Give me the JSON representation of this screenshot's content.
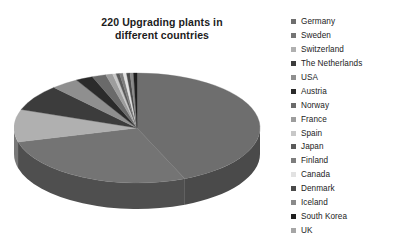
{
  "title": {
    "line1": "220 Upgrading plants in",
    "line2": "different countries"
  },
  "chart_data": {
    "type": "pie",
    "title": "220 Upgrading plants in different countries",
    "subtitle": "",
    "xlabel": "",
    "ylabel": "",
    "total": 220,
    "three_d": true,
    "legend_position": "right",
    "grid": false,
    "categories": [
      "Germany",
      "Sweden",
      "Switzerland",
      "The Netherlands",
      "USA",
      "Austria",
      "Norway",
      "France",
      "Spain",
      "Japan",
      "Finland",
      "Canada",
      "Denmark",
      "Iceland",
      "South Korea",
      "UK"
    ],
    "values": [
      96,
      60,
      21,
      17,
      8,
      5,
      4,
      2,
      1,
      1,
      1,
      1,
      1,
      1,
      1,
      0
    ],
    "slice_colors": [
      "#6e6e6e",
      "#747474",
      "#b0b0b0",
      "#3c3c3c",
      "#8f8f8f",
      "#2b2b2b",
      "#6a6a6a",
      "#9d9d9d",
      "#c8c8c8",
      "#5a5a5a",
      "#7d7d7d",
      "#e2e2e2",
      "#4a4a4a",
      "#8a8a8a",
      "#1f1f1f",
      "#a6a6a6"
    ],
    "side_colors": [
      "#4a4a4a",
      "#4f4f4f",
      "#787878",
      "#282828",
      "#626262",
      "#1d1d1d",
      "#474747",
      "#6b6b6b",
      "#898989",
      "#3d3d3d",
      "#555555",
      "#9a9a9a",
      "#323232",
      "#5e5e5e",
      "#151515",
      "#717171"
    ]
  },
  "legend": {
    "items": [
      {
        "label": "Germany",
        "color": "#6e6e6e"
      },
      {
        "label": "Sweden",
        "color": "#747474"
      },
      {
        "label": "Switzerland",
        "color": "#b0b0b0"
      },
      {
        "label": "The Netherlands",
        "color": "#3c3c3c"
      },
      {
        "label": "USA",
        "color": "#8f8f8f"
      },
      {
        "label": "Austria",
        "color": "#2b2b2b"
      },
      {
        "label": "Norway",
        "color": "#6a6a6a"
      },
      {
        "label": "France",
        "color": "#9d9d9d"
      },
      {
        "label": "Spain",
        "color": "#c8c8c8"
      },
      {
        "label": "Japan",
        "color": "#5a5a5a"
      },
      {
        "label": "Finland",
        "color": "#7d7d7d"
      },
      {
        "label": "Canada",
        "color": "#e2e2e2"
      },
      {
        "label": "Denmark",
        "color": "#4a4a4a"
      },
      {
        "label": "Iceland",
        "color": "#8a8a8a"
      },
      {
        "label": "South Korea",
        "color": "#1f1f1f"
      },
      {
        "label": "UK",
        "color": "#a6a6a6"
      }
    ]
  }
}
